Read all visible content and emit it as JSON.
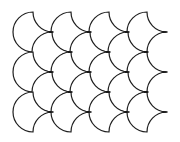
{
  "figure": {
    "width": 180,
    "height": 142,
    "stroke_color": "#1e1e1e",
    "fill_color": "#ffffff",
    "background": "#ffffff",
    "radius": 20,
    "half_width": 19,
    "tiles": [
      {
        "x": 33,
        "y": 12
      },
      {
        "x": 71,
        "y": 12
      },
      {
        "x": 109,
        "y": 12
      },
      {
        "x": 147,
        "y": 12
      },
      {
        "x": 52,
        "y": 32
      },
      {
        "x": 90,
        "y": 32
      },
      {
        "x": 128,
        "y": 32
      },
      {
        "x": 33,
        "y": 52
      },
      {
        "x": 71,
        "y": 52
      },
      {
        "x": 109,
        "y": 52
      },
      {
        "x": 147,
        "y": 52
      },
      {
        "x": 52,
        "y": 72
      },
      {
        "x": 90,
        "y": 72
      },
      {
        "x": 128,
        "y": 72
      },
      {
        "x": 33,
        "y": 92
      },
      {
        "x": 71,
        "y": 92
      },
      {
        "x": 109,
        "y": 92
      },
      {
        "x": 147,
        "y": 92
      }
    ]
  }
}
